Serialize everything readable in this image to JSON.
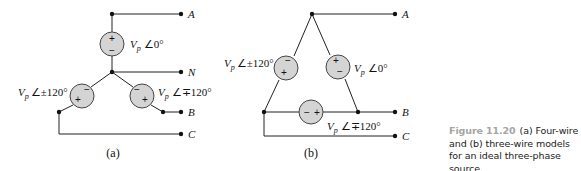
{
  "figure": {
    "number_label": "Figure 11.20",
    "caption_text": "(a) Four-wire and (b) three-wire models for an ideal three-phase source."
  },
  "diagram_a": {
    "sublabel": "(a)",
    "terminals": {
      "A": "A",
      "N": "N",
      "B": "B",
      "C": "C"
    },
    "sources": [
      {
        "id": "top",
        "mag": "V",
        "sub": "p",
        "angle": "∠0°",
        "top_sign": "+",
        "bottom_sign": "−"
      },
      {
        "id": "left",
        "mag": "V",
        "sub": "p",
        "angle": "∠±120°",
        "signs": [
          "+",
          "−"
        ]
      },
      {
        "id": "right",
        "mag": "V",
        "sub": "p",
        "angle": "∠∓120°",
        "signs": [
          "−",
          "+"
        ]
      }
    ]
  },
  "diagram_b": {
    "sublabel": "(b)",
    "terminals": {
      "A": "A",
      "B": "B",
      "C": "C"
    },
    "sources": [
      {
        "id": "left",
        "mag": "V",
        "sub": "p",
        "angle": "∠±120°",
        "signs": [
          "−",
          "+"
        ]
      },
      {
        "id": "right",
        "mag": "V",
        "sub": "p",
        "angle": "∠0°",
        "signs": [
          "+",
          "−"
        ]
      },
      {
        "id": "bottom",
        "mag": "V",
        "sub": "p",
        "angle": "∠∓120°",
        "signs": [
          "−",
          "+"
        ]
      }
    ]
  },
  "colors": {
    "wire": "#222222",
    "source_fill": "#d4d4d4",
    "caption_accent": "#a5a5a5"
  }
}
